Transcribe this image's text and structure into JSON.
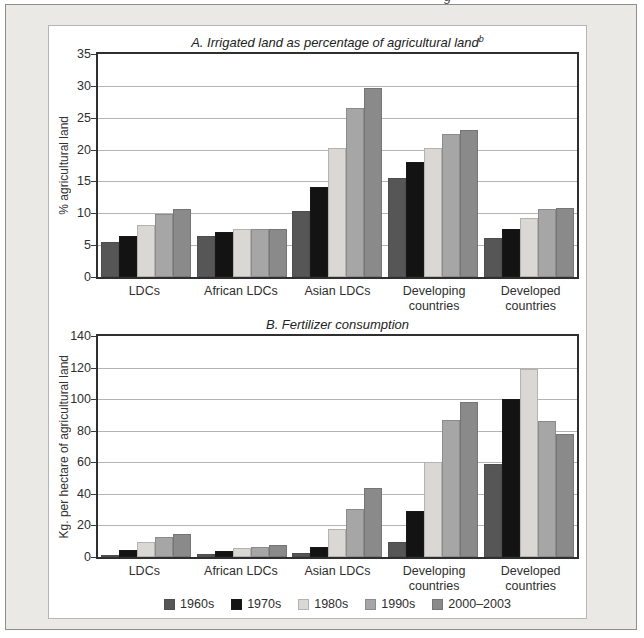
{
  "figure": {
    "panel_background": "#eae9e6",
    "panel_border": "#8e8e8e",
    "card_background": "#ffffff",
    "cropped_text_fragment": "g"
  },
  "legend": {
    "items": [
      {
        "label": "1960s",
        "color": "#565656"
      },
      {
        "label": "1970s",
        "color": "#131313"
      },
      {
        "label": "1980s",
        "color": "#d9d8d5"
      },
      {
        "label": "1990s",
        "color": "#a6a6a6"
      },
      {
        "label": "2000–2003",
        "color": "#8a8a8a"
      }
    ]
  },
  "chart_data": [
    {
      "type": "bar",
      "title": "A. Irrigated land as percentage of agricultural land",
      "title_superscript": "b",
      "xlabel": "",
      "ylabel": "% agricultural land",
      "ylim": [
        0,
        35
      ],
      "yticks": [
        0,
        5,
        10,
        15,
        20,
        25,
        30,
        35
      ],
      "grid": true,
      "legend_position": "bottom-shared",
      "categories": [
        "LDCs",
        "African LDCs",
        "Asian LDCs",
        "Developing countries",
        "Developed countries"
      ],
      "series": [
        {
          "name": "1960s",
          "values": [
            5.5,
            6.4,
            10.4,
            15.5,
            6.1
          ]
        },
        {
          "name": "1970s",
          "values": [
            6.5,
            7.0,
            14.2,
            18.1,
            7.6
          ]
        },
        {
          "name": "1980s",
          "values": [
            8.2,
            7.6,
            20.3,
            20.2,
            9.3
          ]
        },
        {
          "name": "1990s",
          "values": [
            9.9,
            7.5,
            26.6,
            22.4,
            10.6
          ]
        },
        {
          "name": "2000–2003",
          "values": [
            10.6,
            7.5,
            29.7,
            23.0,
            10.9
          ]
        }
      ]
    },
    {
      "type": "bar",
      "title": "B. Fertilizer consumption",
      "title_superscript": "",
      "xlabel": "",
      "ylabel": "Kg. per hectare of agricultural land",
      "ylim": [
        0,
        140
      ],
      "yticks": [
        0,
        20,
        40,
        60,
        80,
        100,
        120,
        140
      ],
      "grid": true,
      "legend_position": "bottom-shared",
      "categories": [
        "LDCs",
        "African LDCs",
        "Asian LDCs",
        "Developing countries",
        "Developed countries"
      ],
      "series": [
        {
          "name": "1960s",
          "values": [
            1.5,
            2.0,
            2.5,
            9.5,
            59
          ]
        },
        {
          "name": "1970s",
          "values": [
            4.7,
            4.0,
            6.6,
            29,
            100
          ]
        },
        {
          "name": "1980s",
          "values": [
            9.3,
            5.8,
            17.5,
            60,
            119
          ]
        },
        {
          "name": "1990s",
          "values": [
            12.8,
            6.4,
            30.5,
            87,
            86
          ]
        },
        {
          "name": "2000–2003",
          "values": [
            14.5,
            7.7,
            44,
            98,
            78
          ]
        }
      ]
    }
  ]
}
